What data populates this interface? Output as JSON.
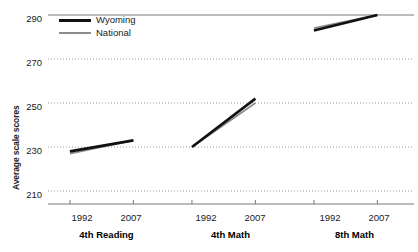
{
  "chart_data": {
    "type": "line",
    "title": "",
    "subtitle": "",
    "xlabel": "",
    "ylabel": "Average scale scores",
    "ylim": [
      205,
      292
    ],
    "yticks": [
      210,
      230,
      250,
      270,
      290
    ],
    "ytick_labels": [
      "210",
      "230",
      "250",
      "270",
      "290"
    ],
    "grid": "horizontal-dotted",
    "legend_position": "top-left",
    "x": [
      1992,
      2007
    ],
    "xtick_labels": [
      "1992",
      "2007"
    ],
    "legend": [
      "Wyoming",
      "National"
    ],
    "colors": {
      "wyoming": "#111111",
      "national": "#8c8c8c",
      "axis": "#7a7a7a",
      "grid": "#9a9a9a"
    },
    "panels": [
      {
        "name": "4th Reading",
        "xtick_labels": [
          "1992",
          "2007"
        ],
        "series": [
          {
            "name": "Wyoming",
            "values": [
              228,
              233
            ]
          },
          {
            "name": "National",
            "values": [
              227,
              233
            ]
          }
        ]
      },
      {
        "name": "4th Math",
        "xtick_labels": [
          "1992",
          "2007"
        ],
        "series": [
          {
            "name": "Wyoming",
            "values": [
              230,
              252
            ]
          },
          {
            "name": "National",
            "values": [
              230,
              250
            ]
          }
        ]
      },
      {
        "name": "8th Math",
        "xtick_labels": [
          "1992",
          "2007"
        ],
        "series": [
          {
            "name": "Wyoming",
            "values": [
              283,
              290
            ]
          },
          {
            "name": "National",
            "values": [
              284,
              290
            ]
          }
        ]
      }
    ]
  },
  "legend": {
    "items": [
      {
        "label": "Wyoming",
        "style": "thick-black"
      },
      {
        "label": "National",
        "style": "thin-gray"
      }
    ]
  },
  "axis": {
    "y_title": "Average scale scores",
    "y_tick_labels": [
      "290",
      "270",
      "250",
      "230",
      "210"
    ]
  },
  "panels": [
    {
      "title": "4th Reading",
      "ticks": [
        "1992",
        "2007"
      ]
    },
    {
      "title": "4th Math",
      "ticks": [
        "1992",
        "2007"
      ]
    },
    {
      "title": "8th Math",
      "ticks": [
        "1992",
        "2007"
      ]
    }
  ]
}
